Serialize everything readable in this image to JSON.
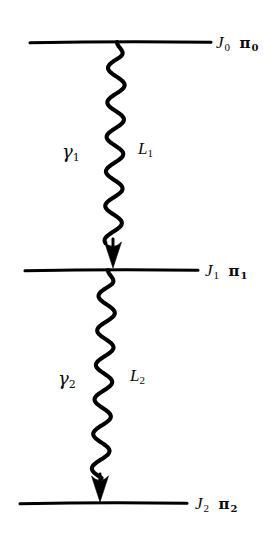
{
  "figure": {
    "kind": "nuclear-level-cascade-diagram",
    "background_color": "#ffffff",
    "stroke_color": "#000000"
  },
  "levels": [
    {
      "id": "level-0",
      "spin_symbol": "J",
      "spin_subscript": "0",
      "parity_symbol": "π",
      "parity_subscript": "0",
      "label_text": "J₀ π₀",
      "line": {
        "x1": 30,
        "x2": 211,
        "y": 42
      },
      "label_x": 216,
      "label_y": 34
    },
    {
      "id": "level-1",
      "spin_symbol": "J",
      "spin_subscript": "1",
      "parity_symbol": "π",
      "parity_subscript": "1",
      "label_text": "J₁ π₁",
      "line": {
        "x1": 25,
        "x2": 198,
        "y": 270
      },
      "label_x": 205,
      "label_y": 262
    },
    {
      "id": "level-2",
      "spin_symbol": "J",
      "spin_subscript": "2",
      "parity_symbol": "π",
      "parity_subscript": "2",
      "label_text": "J₂ π₂",
      "line": {
        "x1": 20,
        "x2": 187,
        "y": 503
      },
      "label_x": 195,
      "label_y": 495
    }
  ],
  "transitions": [
    {
      "id": "transition-1",
      "gamma_symbol": "γ",
      "gamma_subscript": "1",
      "gamma_label": "γ₁",
      "gamma_label_x": 62,
      "gamma_label_y": 143,
      "multipolarity_symbol": "L",
      "multipolarity_subscript": "1",
      "multipolarity_label": "L₁",
      "multipolarity_label_x": 138,
      "multipolarity_label_y": 140,
      "wave": {
        "x_top": 117,
        "x_bottom": 113,
        "y_top": 42,
        "y_bottom": 243,
        "amplitude": 8.5,
        "wavelength": 34.5,
        "stroke_width": 4.1
      },
      "arrow": {
        "x": 113,
        "y_tip": 268,
        "width": 17,
        "height": 26
      }
    },
    {
      "id": "transition-2",
      "gamma_symbol": "γ",
      "gamma_subscript": "2",
      "gamma_label": "γ₂",
      "gamma_label_x": 58,
      "gamma_label_y": 370,
      "multipolarity_symbol": "L",
      "multipolarity_subscript": "2",
      "multipolarity_label": "L₂",
      "multipolarity_label_x": 130,
      "multipolarity_label_y": 367,
      "wave": {
        "x_top": 108,
        "x_bottom": 100,
        "y_top": 270,
        "y_bottom": 478,
        "amplitude": 8.5,
        "wavelength": 34.5,
        "stroke_width": 4.1
      },
      "arrow": {
        "x": 100,
        "y_tip": 502,
        "width": 17,
        "height": 26
      }
    }
  ]
}
